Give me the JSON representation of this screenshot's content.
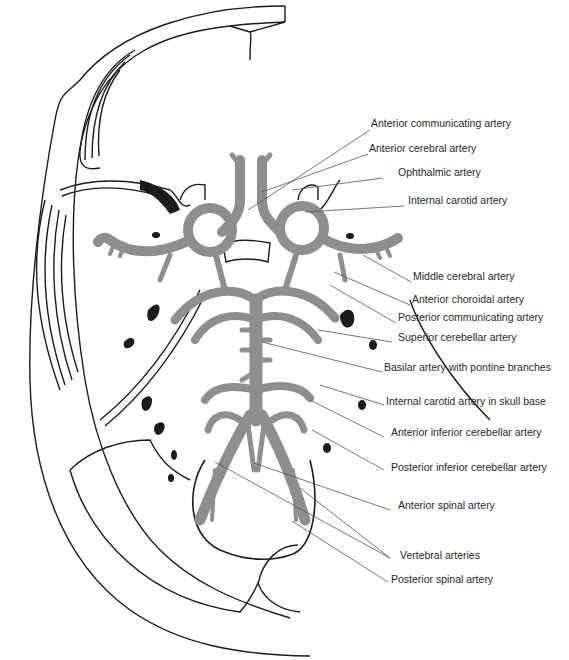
{
  "figure": {
    "colors": {
      "artery": "#8e8e8e",
      "outline": "#1a1a1a",
      "leader": "#555555",
      "text": "#2a2a2a",
      "background": "#ffffff"
    },
    "labels": [
      {
        "id": "anterior-communicating-artery",
        "text": "Anterior communicating artery",
        "x": 371,
        "y": 123,
        "lx1": 248,
        "ly1": 210,
        "lx2": 370,
        "ly2": 130
      },
      {
        "id": "anterior-cerebral-artery",
        "text": "Anterior cerebral artery",
        "x": 369,
        "y": 148,
        "lx1": 262,
        "ly1": 192,
        "lx2": 368,
        "ly2": 154
      },
      {
        "id": "ophthalmic-artery",
        "text": "Ophthalmic artery",
        "x": 398,
        "y": 172,
        "lx1": 292,
        "ly1": 190,
        "lx2": 383,
        "ly2": 178
      },
      {
        "id": "internal-carotid-artery",
        "text": "Internal carotid artery",
        "x": 408,
        "y": 200,
        "lx1": 305,
        "ly1": 212,
        "lx2": 404,
        "ly2": 206
      },
      {
        "id": "middle-cerebral-artery",
        "text": "Middle cerebral artery",
        "x": 413,
        "y": 276,
        "lx1": 363,
        "ly1": 255,
        "lx2": 411,
        "ly2": 282
      },
      {
        "id": "anterior-choroidal-artery",
        "text": "Anterior choroidal artery",
        "x": 412,
        "y": 299,
        "lx1": 334,
        "ly1": 272,
        "lx2": 410,
        "ly2": 305
      },
      {
        "id": "posterior-communicating-artery",
        "text": "Posterior communicating artery",
        "x": 398,
        "y": 317,
        "lx1": 330,
        "ly1": 285,
        "lx2": 396,
        "ly2": 323
      },
      {
        "id": "superior-cerebellar-artery",
        "text": "Superior cerebellar artery",
        "x": 398,
        "y": 337,
        "lx1": 318,
        "ly1": 330,
        "lx2": 392,
        "ly2": 342
      },
      {
        "id": "basilar-artery-with-pontine-branches",
        "text": "Basilar artery with pontine branches",
        "x": 384,
        "y": 367,
        "lx1": 262,
        "ly1": 342,
        "lx2": 382,
        "ly2": 372
      },
      {
        "id": "internal-carotid-artery-in-skull-base",
        "text": "Internal carotid artery in skull base",
        "x": 386,
        "y": 401,
        "lx1": 320,
        "ly1": 385,
        "lx2": 384,
        "ly2": 405
      },
      {
        "id": "anterior-inferior-cerebellar-artery",
        "text": "Anterior inferior cerebellar artery",
        "x": 391,
        "y": 432,
        "lx1": 310,
        "ly1": 400,
        "lx2": 384,
        "ly2": 437
      },
      {
        "id": "posterior-inferior-cerebellar-artery",
        "text": "Posterior inferior cerebellar artery",
        "x": 391,
        "y": 467,
        "lx1": 312,
        "ly1": 430,
        "lx2": 384,
        "ly2": 470
      },
      {
        "id": "anterior-spinal-artery",
        "text": "Anterior spinal artery",
        "x": 398,
        "y": 505,
        "lx1": 254,
        "ly1": 463,
        "lx2": 390,
        "ly2": 510
      },
      {
        "id": "vertebral-arteries",
        "text": "Vertebral arteries",
        "x": 400,
        "y": 555,
        "lx1": 390,
        "ly1": 558,
        "lx2": 390,
        "ly2": 558
      },
      {
        "id": "posterior-spinal-artery",
        "text": "Posterior spinal artery",
        "x": 391,
        "y": 579,
        "lx1": 292,
        "ly1": 521,
        "lx2": 388,
        "ly2": 582
      }
    ],
    "vertebral_leaders": [
      {
        "x1": 215,
        "y1": 462,
        "x2": 390,
        "y2": 558
      },
      {
        "x1": 300,
        "y1": 488,
        "x2": 390,
        "y2": 558
      }
    ]
  }
}
